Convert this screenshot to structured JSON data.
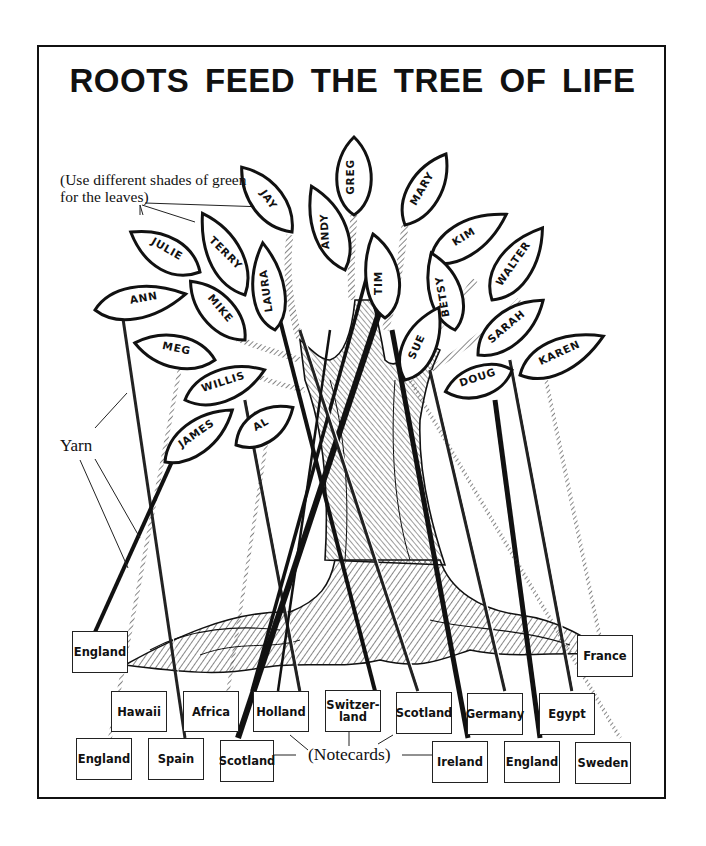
{
  "title": "ROOTS  FEED THE TREE OF  LIFE",
  "annotations": {
    "leaves_note": "(Use different shades of green for the leaves)",
    "yarn_label": "Yarn",
    "notecards_label": "(Notecards)"
  },
  "leaves": [
    {
      "name": "JAY"
    },
    {
      "name": "GREG"
    },
    {
      "name": "MARY"
    },
    {
      "name": "JULIE"
    },
    {
      "name": "TERRY"
    },
    {
      "name": "ANDY"
    },
    {
      "name": "KIM"
    },
    {
      "name": "WALTER"
    },
    {
      "name": "ANN"
    },
    {
      "name": "MIKE"
    },
    {
      "name": "LAURA"
    },
    {
      "name": "TIM"
    },
    {
      "name": "BETSY"
    },
    {
      "name": "MEG"
    },
    {
      "name": "SUE"
    },
    {
      "name": "SARAH"
    },
    {
      "name": "KAREN"
    },
    {
      "name": "WILLIS"
    },
    {
      "name": "DOUG"
    },
    {
      "name": "JAMES"
    },
    {
      "name": "AL"
    }
  ],
  "notecards": [
    {
      "label": "England"
    },
    {
      "label": "France"
    },
    {
      "label": "Hawaii"
    },
    {
      "label": "Africa"
    },
    {
      "label": "Holland"
    },
    {
      "label": "Switzer-\nland"
    },
    {
      "label": "Scotland"
    },
    {
      "label": "Germany"
    },
    {
      "label": "Egypt"
    },
    {
      "label": "England"
    },
    {
      "label": "Spain"
    },
    {
      "label": "Scotland"
    },
    {
      "label": "Ireland"
    },
    {
      "label": "England"
    },
    {
      "label": "Sweden"
    }
  ]
}
